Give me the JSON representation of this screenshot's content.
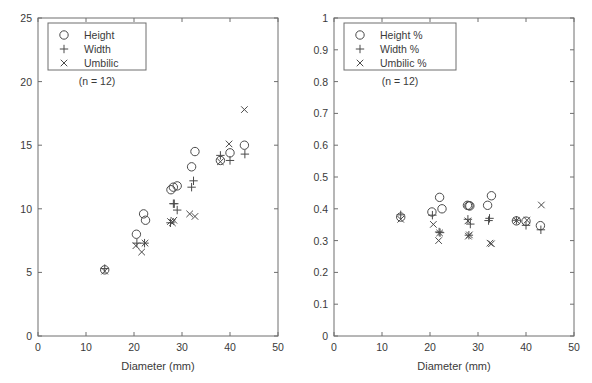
{
  "figure": {
    "background_color": "#ffffff",
    "axis_color": "#6e6e6e",
    "marker_color": "#4a4a4a",
    "text_color": "#3a3a3a"
  },
  "chart_data": [
    {
      "type": "scatter",
      "panel": "left",
      "title": "",
      "xlabel": "Diameter (mm)",
      "ylabel": "",
      "xlim": [
        0,
        50
      ],
      "ylim": [
        0,
        25
      ],
      "xticks": [
        0,
        10,
        20,
        30,
        40,
        50
      ],
      "yticks": [
        0,
        5,
        10,
        15,
        20,
        25
      ],
      "xtick_labels": [
        "0",
        "10",
        "20",
        "30",
        "40",
        "50"
      ],
      "ytick_labels": [
        "0",
        "5",
        "10",
        "15",
        "20",
        "25"
      ],
      "grid": false,
      "legend_position": "top-left",
      "annotation": "(n = 12)",
      "series": [
        {
          "name": "Height",
          "marker": "circle",
          "points": [
            {
              "x": 13.9,
              "y": 5.2
            },
            {
              "x": 20.5,
              "y": 8.0
            },
            {
              "x": 22.0,
              "y": 9.6
            },
            {
              "x": 22.4,
              "y": 9.1
            },
            {
              "x": 27.7,
              "y": 11.5
            },
            {
              "x": 28.2,
              "y": 11.7
            },
            {
              "x": 29.0,
              "y": 11.8
            },
            {
              "x": 32.0,
              "y": 13.3
            },
            {
              "x": 32.7,
              "y": 14.5
            },
            {
              "x": 38.0,
              "y": 13.8
            },
            {
              "x": 40.0,
              "y": 14.4
            },
            {
              "x": 43.0,
              "y": 15.0
            }
          ]
        },
        {
          "name": "Width",
          "marker": "plus",
          "points": [
            {
              "x": 13.9,
              "y": 5.3
            },
            {
              "x": 20.6,
              "y": 7.3
            },
            {
              "x": 22.2,
              "y": 7.3
            },
            {
              "x": 28.2,
              "y": 10.4
            },
            {
              "x": 28.4,
              "y": 10.4
            },
            {
              "x": 27.6,
              "y": 8.9
            },
            {
              "x": 29.0,
              "y": 9.9
            },
            {
              "x": 32.0,
              "y": 11.7
            },
            {
              "x": 32.4,
              "y": 12.2
            },
            {
              "x": 38.0,
              "y": 14.2
            },
            {
              "x": 40.0,
              "y": 13.8
            },
            {
              "x": 43.1,
              "y": 14.3
            }
          ]
        },
        {
          "name": "Umbilic",
          "marker": "cross",
          "points": [
            {
              "x": 13.9,
              "y": 5.1
            },
            {
              "x": 20.4,
              "y": 7.1
            },
            {
              "x": 22.3,
              "y": 7.3
            },
            {
              "x": 21.6,
              "y": 6.6
            },
            {
              "x": 27.6,
              "y": 9.0
            },
            {
              "x": 28.3,
              "y": 9.1
            },
            {
              "x": 28.0,
              "y": 8.9
            },
            {
              "x": 31.6,
              "y": 9.6
            },
            {
              "x": 32.7,
              "y": 9.4
            },
            {
              "x": 38.0,
              "y": 13.7
            },
            {
              "x": 39.8,
              "y": 15.1
            },
            {
              "x": 43.0,
              "y": 17.8
            }
          ]
        }
      ]
    },
    {
      "type": "scatter",
      "panel": "right",
      "title": "",
      "xlabel": "Diameter (mm)",
      "ylabel": "",
      "xlim": [
        0,
        50
      ],
      "ylim": [
        0,
        1
      ],
      "xticks": [
        0,
        10,
        20,
        30,
        40,
        50
      ],
      "yticks": [
        0,
        0.1,
        0.2,
        0.3,
        0.4,
        0.5,
        0.6,
        0.7,
        0.8,
        0.9,
        1
      ],
      "xtick_labels": [
        "0",
        "10",
        "20",
        "30",
        "40",
        "50"
      ],
      "ytick_labels": [
        "0",
        "0.1",
        "0.2",
        "0.3",
        "0.4",
        "0.5",
        "0.6",
        "0.7",
        "0.8",
        "0.9",
        "1"
      ],
      "grid": false,
      "legend_position": "top-left",
      "annotation": "(n = 12)",
      "series": [
        {
          "name": "Height %",
          "marker": "circle",
          "points": [
            {
              "x": 13.9,
              "y": 0.374
            },
            {
              "x": 20.4,
              "y": 0.39
            },
            {
              "x": 22.0,
              "y": 0.436
            },
            {
              "x": 22.5,
              "y": 0.4
            },
            {
              "x": 27.8,
              "y": 0.411
            },
            {
              "x": 28.3,
              "y": 0.409
            },
            {
              "x": 32.0,
              "y": 0.411
            },
            {
              "x": 32.8,
              "y": 0.441
            },
            {
              "x": 38.0,
              "y": 0.362
            },
            {
              "x": 40.0,
              "y": 0.361
            },
            {
              "x": 43.0,
              "y": 0.347
            },
            {
              "x": 28.1,
              "y": 0.41
            }
          ]
        },
        {
          "name": "Width %",
          "marker": "plus",
          "points": [
            {
              "x": 13.9,
              "y": 0.381
            },
            {
              "x": 20.5,
              "y": 0.38
            },
            {
              "x": 22.1,
              "y": 0.325
            },
            {
              "x": 21.9,
              "y": 0.327
            },
            {
              "x": 27.9,
              "y": 0.367
            },
            {
              "x": 28.4,
              "y": 0.352
            },
            {
              "x": 28.1,
              "y": 0.317
            },
            {
              "x": 32.4,
              "y": 0.37
            },
            {
              "x": 32.2,
              "y": 0.363
            },
            {
              "x": 38.0,
              "y": 0.364
            },
            {
              "x": 40.0,
              "y": 0.348
            },
            {
              "x": 43.1,
              "y": 0.334
            }
          ]
        },
        {
          "name": "Umbilic %",
          "marker": "cross",
          "points": [
            {
              "x": 13.9,
              "y": 0.367
            },
            {
              "x": 20.7,
              "y": 0.351
            },
            {
              "x": 22.0,
              "y": 0.324
            },
            {
              "x": 21.8,
              "y": 0.3
            },
            {
              "x": 27.9,
              "y": 0.362
            },
            {
              "x": 28.2,
              "y": 0.318
            },
            {
              "x": 28.0,
              "y": 0.314
            },
            {
              "x": 32.5,
              "y": 0.292
            },
            {
              "x": 32.8,
              "y": 0.29
            },
            {
              "x": 38.0,
              "y": 0.363
            },
            {
              "x": 40.2,
              "y": 0.364
            },
            {
              "x": 43.2,
              "y": 0.412
            }
          ]
        }
      ]
    }
  ]
}
